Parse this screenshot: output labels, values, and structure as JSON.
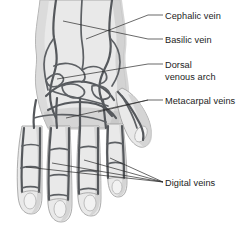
{
  "figure": {
    "orientation": "dorsal view of left hand and distal forearm",
    "background_color": "#ffffff",
    "skin_fill_color": "#e9e9e9",
    "skin_shade_color": "#cfcfcf",
    "vein_stroke_color": "#55585c",
    "leader_line_color": "#2a2a2a",
    "text_color": "#1c1c1c"
  },
  "labels": [
    {
      "id": "cephalic-vein",
      "text": "Cephalic vein",
      "text_x": 165,
      "text_y": 19,
      "leader_points": "163,15 148,15 86,39",
      "lines": 1
    },
    {
      "id": "basilic-vein",
      "text": "Basilic vein",
      "text_x": 165,
      "text_y": 43,
      "leader_points": "163,39 148,39 63,21",
      "lines": 1
    },
    {
      "id": "dorsal-venous-arch",
      "text": "Dorsal",
      "text_line2": "venous arch",
      "text_x": 165,
      "text_y": 68,
      "text2_x": 165,
      "text2_y": 80,
      "leader_points": "163,64 148,64 57,79",
      "lines": 2
    },
    {
      "id": "metacarpal-veins",
      "text": "Metacarpal veins",
      "text_x": 165,
      "text_y": 104,
      "leader_points": "163,100 148,100 66,118",
      "leader_points_2": "148,100 98,112",
      "lines": 1
    },
    {
      "id": "digital-veins",
      "text": "Digital veins",
      "text_x": 165,
      "text_y": 186,
      "leader_points": "163,182 110,158",
      "leader_points_2": "163,182 84,160",
      "leader_points_3": "163,182 52,163",
      "leader_points_4": "163,182 26,167",
      "lines": 1
    }
  ],
  "anatomy": {
    "structures": [
      "Cephalic vein",
      "Basilic vein",
      "Dorsal venous arch",
      "Metacarpal veins",
      "Digital veins"
    ],
    "digits": [
      "thumb",
      "index finger",
      "middle finger",
      "ring finger",
      "little finger"
    ]
  }
}
